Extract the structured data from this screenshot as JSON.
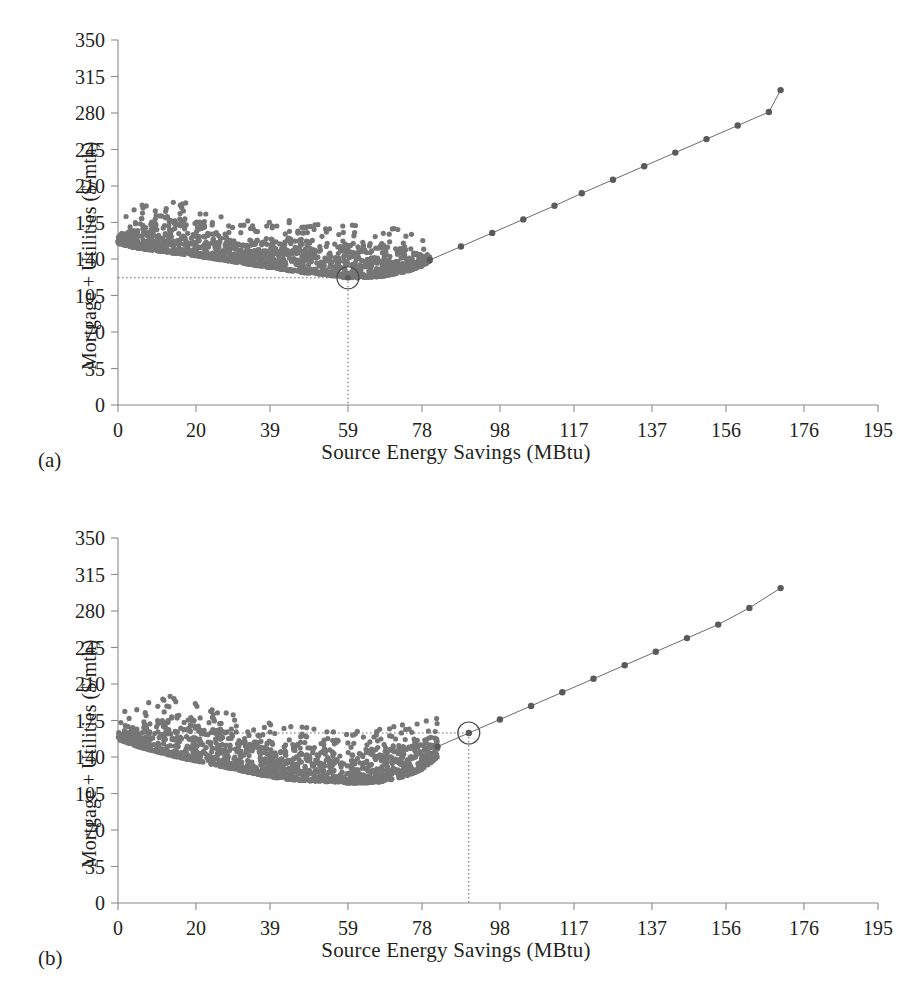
{
  "figure": {
    "panels": [
      {
        "id": "a",
        "label": "(a)",
        "xlabel": "Source Energy Savings (MBtu)",
        "ylabel": "Mortgage + Utilities ($/mth)",
        "optimum": {
          "x": 59,
          "y": 122,
          "marker": "circle-highlight"
        }
      },
      {
        "id": "b",
        "label": "(b)",
        "xlabel": "Source Energy Savings (MBtu)",
        "ylabel": "Mortgage + Utilities ($/mth)",
        "optimum": {
          "x": 90,
          "y": 163,
          "marker": "circle-highlight"
        }
      }
    ]
  },
  "chart_data": [
    {
      "type": "scatter",
      "panel": "a",
      "title": "",
      "xlabel": "Source Energy Savings (MBtu)",
      "ylabel": "Mortgage + Utilities ($/mth)",
      "xlim": [
        0,
        195
      ],
      "ylim": [
        0,
        350
      ],
      "xticks": [
        0,
        20,
        39,
        59,
        78,
        98,
        117,
        137,
        156,
        176,
        195
      ],
      "ytick_labels": [
        0,
        35,
        70,
        105,
        140,
        175,
        210,
        245,
        280,
        315,
        350
      ],
      "grid": false,
      "legend": null,
      "annotations": [
        {
          "text": "optimum point",
          "x": 59,
          "y": 122,
          "style": "open-circle with dotted drop lines to both axes"
        }
      ],
      "series": [
        {
          "name": "design cloud",
          "kind": "scatter",
          "marker_color": "#767676",
          "x_range": [
            0,
            80
          ],
          "lower_envelope": [
            [
              0,
              155
            ],
            [
              5,
              150
            ],
            [
              10,
              148
            ],
            [
              15,
              145
            ],
            [
              20,
              143
            ],
            [
              25,
              140
            ],
            [
              30,
              137
            ],
            [
              35,
              134
            ],
            [
              39,
              132
            ],
            [
              45,
              128
            ],
            [
              50,
              126
            ],
            [
              55,
              124
            ],
            [
              59,
              122
            ],
            [
              63,
              122
            ],
            [
              67,
              123
            ],
            [
              70,
              125
            ],
            [
              74,
              128
            ],
            [
              78,
              133
            ],
            [
              80,
              138
            ]
          ],
          "upper_envelope": [
            [
              0,
              162
            ],
            [
              5,
              172
            ],
            [
              10,
              182
            ],
            [
              15,
              180
            ],
            [
              20,
              178
            ],
            [
              25,
              165
            ],
            [
              30,
              160
            ],
            [
              35,
              158
            ],
            [
              39,
              160
            ],
            [
              45,
              160
            ],
            [
              50,
              158
            ],
            [
              55,
              156
            ],
            [
              59,
              155
            ],
            [
              63,
              155
            ],
            [
              67,
              156
            ],
            [
              70,
              155
            ],
            [
              74,
              152
            ],
            [
              78,
              148
            ],
            [
              80,
              145
            ]
          ],
          "n_points": 1400
        },
        {
          "name": "efficiency frontier",
          "kind": "line-with-markers",
          "line_color": "#6b6b6b",
          "marker_color": "#5a5a5a",
          "x": [
            80,
            88,
            96,
            104,
            112,
            119,
            127,
            135,
            143,
            151,
            159,
            167,
            170
          ],
          "y": [
            139,
            152,
            165,
            178,
            191,
            203,
            216,
            229,
            242,
            255,
            268,
            281,
            302
          ]
        }
      ]
    },
    {
      "type": "scatter",
      "panel": "b",
      "title": "",
      "xlabel": "Source Energy Savings (MBtu)",
      "ylabel": "Mortgage + Utilities ($/mth)",
      "xlim": [
        0,
        195
      ],
      "ylim": [
        0,
        350
      ],
      "xticks": [
        0,
        20,
        39,
        59,
        78,
        98,
        117,
        137,
        156,
        176,
        195
      ],
      "ytick_labels": [
        0,
        35,
        70,
        105,
        140,
        175,
        210,
        245,
        280,
        315,
        350
      ],
      "grid": false,
      "legend": null,
      "annotations": [
        {
          "text": "optimum point",
          "x": 90,
          "y": 163,
          "style": "open-circle with dotted line to y-axis and dotted drop to x-axis"
        }
      ],
      "series": [
        {
          "name": "design cloud",
          "kind": "scatter",
          "marker_color": "#767676",
          "x_range": [
            0,
            82
          ],
          "lower_envelope": [
            [
              0,
              157
            ],
            [
              5,
              150
            ],
            [
              10,
              145
            ],
            [
              15,
              140
            ],
            [
              20,
              136
            ],
            [
              25,
              132
            ],
            [
              30,
              128
            ],
            [
              35,
              124
            ],
            [
              39,
              121
            ],
            [
              45,
              118
            ],
            [
              50,
              117
            ],
            [
              55,
              116
            ],
            [
              59,
              115
            ],
            [
              63,
              115
            ],
            [
              67,
              116
            ],
            [
              70,
              118
            ],
            [
              74,
              122
            ],
            [
              78,
              128
            ],
            [
              82,
              140
            ]
          ],
          "upper_envelope": [
            [
              0,
              163
            ],
            [
              5,
              172
            ],
            [
              10,
              178
            ],
            [
              15,
              182
            ],
            [
              20,
              175
            ],
            [
              25,
              168
            ],
            [
              30,
              163
            ],
            [
              35,
              158
            ],
            [
              39,
              155
            ],
            [
              45,
              152
            ],
            [
              50,
              150
            ],
            [
              55,
              148
            ],
            [
              59,
              147
            ],
            [
              63,
              148
            ],
            [
              67,
              150
            ],
            [
              70,
              152
            ],
            [
              74,
              155
            ],
            [
              78,
              158
            ],
            [
              82,
              160
            ]
          ],
          "n_points": 1400
        },
        {
          "name": "efficiency frontier",
          "kind": "line-with-markers",
          "line_color": "#6b6b6b",
          "marker_color": "#5a5a5a",
          "x": [
            82,
            90,
            98,
            106,
            114,
            122,
            130,
            138,
            146,
            154,
            162,
            170
          ],
          "y": [
            150,
            163,
            176,
            189,
            202,
            215,
            228,
            241,
            254,
            267,
            283,
            302
          ]
        }
      ]
    }
  ]
}
